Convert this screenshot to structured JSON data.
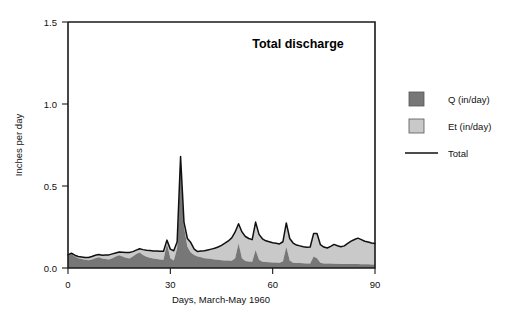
{
  "chart_data": {
    "type": "area",
    "title": "Total discharge",
    "xlabel": "Days, March-May 1960",
    "ylabel": "Inches per day",
    "xlim": [
      0,
      90
    ],
    "ylim": [
      0.0,
      1.5
    ],
    "xticks": [
      0,
      30,
      60,
      90
    ],
    "xtick_labels": [
      "0",
      "30",
      "60",
      "90"
    ],
    "yticks": [
      0.0,
      0.5,
      1.0,
      1.5
    ],
    "ytick_labels": [
      "0.0",
      "0.5",
      "1.0",
      "1.5"
    ],
    "grid": false,
    "stacked": true,
    "legend_position": "right",
    "colors": {
      "q_fill": "#777777",
      "et_fill": "#c9c9c9",
      "total_line": "#111111",
      "axis": "#1a1a1a",
      "background": "#ffffff"
    },
    "legend": [
      {
        "label": "Q (in/day)",
        "marker": "swatch",
        "color": "#777777"
      },
      {
        "label": "Et (in/day)",
        "marker": "swatch",
        "color": "#c9c9c9"
      },
      {
        "label": "Total",
        "marker": "line",
        "color": "#111111"
      }
    ],
    "x": [
      0,
      1,
      2,
      3,
      4,
      5,
      6,
      7,
      8,
      9,
      10,
      11,
      12,
      13,
      14,
      15,
      16,
      17,
      18,
      19,
      20,
      21,
      22,
      23,
      24,
      25,
      26,
      27,
      28,
      29,
      30,
      31,
      32,
      33,
      34,
      35,
      36,
      37,
      38,
      39,
      40,
      41,
      42,
      43,
      44,
      45,
      46,
      47,
      48,
      49,
      50,
      51,
      52,
      53,
      54,
      55,
      56,
      57,
      58,
      59,
      60,
      61,
      62,
      63,
      64,
      65,
      66,
      67,
      68,
      69,
      70,
      71,
      72,
      73,
      74,
      75,
      76,
      77,
      78,
      79,
      80,
      81,
      82,
      83,
      84,
      85,
      86,
      87,
      88,
      89,
      90
    ],
    "series": [
      {
        "name": "Q (in/day)",
        "values": [
          0.075,
          0.085,
          0.07,
          0.06,
          0.055,
          0.05,
          0.048,
          0.052,
          0.06,
          0.066,
          0.058,
          0.055,
          0.052,
          0.06,
          0.07,
          0.078,
          0.07,
          0.062,
          0.058,
          0.07,
          0.085,
          0.095,
          0.08,
          0.068,
          0.062,
          0.058,
          0.055,
          0.052,
          0.05,
          0.15,
          0.06,
          0.045,
          0.12,
          0.66,
          0.25,
          0.13,
          0.095,
          0.08,
          0.07,
          0.065,
          0.06,
          0.058,
          0.055,
          0.052,
          0.05,
          0.048,
          0.046,
          0.045,
          0.044,
          0.06,
          0.15,
          0.06,
          0.042,
          0.04,
          0.038,
          0.11,
          0.05,
          0.038,
          0.036,
          0.035,
          0.034,
          0.033,
          0.032,
          0.04,
          0.13,
          0.045,
          0.032,
          0.03,
          0.03,
          0.029,
          0.028,
          0.028,
          0.07,
          0.06,
          0.032,
          0.028,
          0.027,
          0.027,
          0.026,
          0.026,
          0.025,
          0.025,
          0.025,
          0.024,
          0.024,
          0.024,
          0.023,
          0.023,
          0.023,
          0.022,
          0.022
        ]
      },
      {
        "name": "Et (in/day)",
        "values": [
          0.005,
          0.005,
          0.008,
          0.01,
          0.012,
          0.014,
          0.016,
          0.018,
          0.018,
          0.016,
          0.02,
          0.024,
          0.028,
          0.026,
          0.022,
          0.02,
          0.026,
          0.032,
          0.036,
          0.03,
          0.024,
          0.022,
          0.032,
          0.04,
          0.044,
          0.046,
          0.048,
          0.05,
          0.052,
          0.02,
          0.055,
          0.06,
          0.04,
          0.02,
          0.03,
          0.05,
          0.06,
          0.035,
          0.03,
          0.038,
          0.045,
          0.052,
          0.06,
          0.068,
          0.078,
          0.09,
          0.105,
          0.12,
          0.14,
          0.16,
          0.12,
          0.16,
          0.15,
          0.14,
          0.135,
          0.17,
          0.155,
          0.14,
          0.13,
          0.125,
          0.12,
          0.118,
          0.115,
          0.12,
          0.145,
          0.135,
          0.12,
          0.11,
          0.105,
          0.1,
          0.098,
          0.1,
          0.14,
          0.15,
          0.11,
          0.1,
          0.095,
          0.105,
          0.118,
          0.11,
          0.105,
          0.11,
          0.125,
          0.14,
          0.15,
          0.158,
          0.15,
          0.14,
          0.135,
          0.13,
          0.128
        ]
      }
    ],
    "total": {
      "name": "Total",
      "values": [
        0.08,
        0.09,
        0.078,
        0.07,
        0.067,
        0.064,
        0.064,
        0.07,
        0.078,
        0.082,
        0.078,
        0.079,
        0.08,
        0.086,
        0.092,
        0.098,
        0.096,
        0.094,
        0.094,
        0.1,
        0.109,
        0.117,
        0.112,
        0.108,
        0.106,
        0.104,
        0.103,
        0.102,
        0.102,
        0.17,
        0.115,
        0.105,
        0.16,
        0.68,
        0.28,
        0.18,
        0.155,
        0.115,
        0.1,
        0.103,
        0.105,
        0.11,
        0.115,
        0.12,
        0.128,
        0.138,
        0.151,
        0.165,
        0.184,
        0.22,
        0.27,
        0.22,
        0.192,
        0.18,
        0.173,
        0.28,
        0.205,
        0.178,
        0.166,
        0.16,
        0.154,
        0.151,
        0.147,
        0.16,
        0.275,
        0.18,
        0.152,
        0.14,
        0.135,
        0.129,
        0.126,
        0.128,
        0.21,
        0.21,
        0.142,
        0.128,
        0.122,
        0.132,
        0.144,
        0.136,
        0.13,
        0.135,
        0.15,
        0.164,
        0.174,
        0.182,
        0.173,
        0.163,
        0.158,
        0.152,
        0.15
      ]
    }
  }
}
